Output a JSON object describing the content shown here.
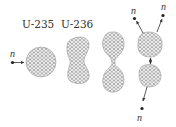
{
  "diagram": {
    "labels": {
      "u235": "U-235",
      "u236": "U-236",
      "neutron": "n"
    },
    "stages": [
      {
        "id": "incoming-neutron",
        "label": "n"
      },
      {
        "id": "u235-nucleus",
        "label": "U-235"
      },
      {
        "id": "u236-elongated",
        "label": "U-236"
      },
      {
        "id": "necked-nucleus",
        "label": ""
      },
      {
        "id": "fission-fragments",
        "label": ""
      }
    ],
    "emitted_neutrons": [
      "n",
      "n",
      "n"
    ],
    "colors": {
      "nucleon_stroke": "#6e6e6e",
      "nucleus_fill": "#f4f4f4",
      "text": "#333333",
      "arrow": "#333333"
    }
  }
}
